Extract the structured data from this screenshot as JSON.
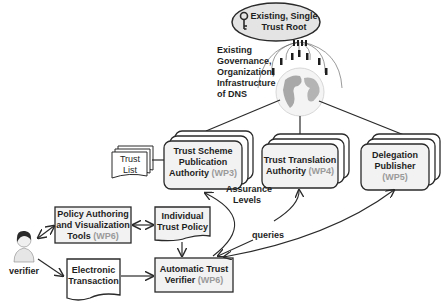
{
  "root": {
    "line1": "Existing, Single",
    "line2": "Trust Root",
    "icon": "key-icon"
  },
  "governance": {
    "lines": [
      "Existing",
      "Governance,",
      "Organization,",
      "Infrastructure",
      "of DNS"
    ]
  },
  "nodes": {
    "tspa": {
      "line1": "Trust Scheme",
      "line2": "Publication",
      "line3": "Authority",
      "wp": "(WP3)"
    },
    "tta": {
      "line1": "Trust Translation",
      "line2": "Authority",
      "wp": "(WP4)"
    },
    "dp": {
      "line1": "Delegation",
      "line2": "Publisher",
      "wp": "(WP5)"
    },
    "trust_list": {
      "line1": "Trust",
      "line2": "List"
    },
    "pavt": {
      "line1": "Policy Authoring",
      "line2": "and Visualization",
      "line3": "Tools",
      "wp": "(WP6)"
    },
    "itp": {
      "line1": "Individual",
      "line2": "Trust Policy"
    },
    "et": {
      "line1": "Electronic",
      "line2": "Transaction"
    },
    "atv": {
      "line1": "Automatic Trust",
      "line2": "Verifier",
      "wp": "(WP6)"
    },
    "verifier": {
      "label": "verifier",
      "icon": "person-icon"
    }
  },
  "edge_labels": {
    "assurance1": "Assurance",
    "assurance2": "Levels",
    "queries": "queries"
  },
  "colors": {
    "box_fill": "#f2f2f2",
    "stroke": "#2a2a2a",
    "wp_gray": "#9a9a9a"
  }
}
